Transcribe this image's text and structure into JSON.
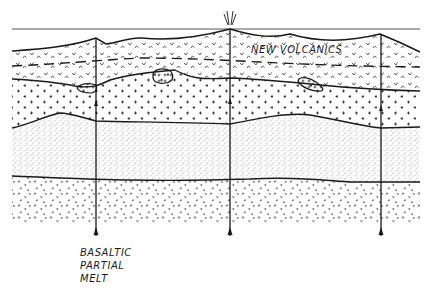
{
  "figure": {
    "type": "geological-cross-section",
    "width": 438,
    "height": 297,
    "colors": {
      "ink": "#1a1a1a",
      "stipple": "#8a8a8a",
      "background": "#ffffff"
    }
  },
  "labels": {
    "new_volcanics": "NEW VOLCANICS",
    "basaltic_partial_melt": [
      "BASALTIC",
      "PARTIAL",
      "MELT"
    ]
  },
  "layers": [
    {
      "name": "new-volcanics",
      "pattern": "v-marks",
      "note": "upper volcanic pile with dashed internal horizon"
    },
    {
      "name": "plus-layer",
      "pattern": "plus-signs",
      "note": "contains lens-shaped intrusive bodies"
    },
    {
      "name": "fine-stipple-layer",
      "pattern": "fine-stipple"
    },
    {
      "name": "coarse-dash-layer",
      "pattern": "coarse-dashes"
    }
  ],
  "feeders": [
    {
      "name": "feeder-left",
      "x": 96
    },
    {
      "name": "feeder-center",
      "x": 230
    },
    {
      "name": "feeder-right",
      "x": 381
    }
  ],
  "vent": {
    "x": 230,
    "symbol": "eruption-rays"
  }
}
